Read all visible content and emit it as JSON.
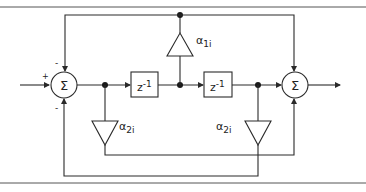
{
  "diagram": {
    "type": "block-diagram",
    "summers": [
      {
        "id": "sum-input",
        "symbol": "Σ",
        "signs": {
          "input": "+",
          "top": "-",
          "bottom": "-"
        }
      },
      {
        "id": "sum-output",
        "symbol": "Σ"
      }
    ],
    "delays": [
      {
        "id": "delay-1",
        "label": "z-1",
        "base": "z",
        "exp": "-1"
      },
      {
        "id": "delay-2",
        "label": "z-1",
        "base": "z",
        "exp": "-1"
      }
    ],
    "gains": [
      {
        "id": "gain-alpha-1i",
        "symbol": "α",
        "sub": "1i",
        "label": "α1i"
      },
      {
        "id": "gain-alpha-2i-left",
        "symbol": "α",
        "sub": "2i",
        "label": "α2i"
      },
      {
        "id": "gain-alpha-2i-right",
        "symbol": "α",
        "sub": "2i",
        "label": "α2i"
      }
    ],
    "signs": {
      "plus": "+",
      "minus": "-"
    }
  }
}
